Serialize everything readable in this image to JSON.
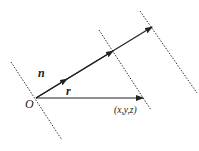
{
  "diagram": {
    "labels": {
      "origin": "O",
      "normal": "n",
      "position": "r",
      "point": "(x,y,z)"
    },
    "elements": {
      "planes": [
        "plane-left",
        "plane-middle",
        "plane-right"
      ],
      "vectors": [
        "normal-vector-n",
        "position-vector-r"
      ]
    },
    "colors": {
      "line": "#222222",
      "dotted": "#333333",
      "background": "#ffffff"
    }
  }
}
